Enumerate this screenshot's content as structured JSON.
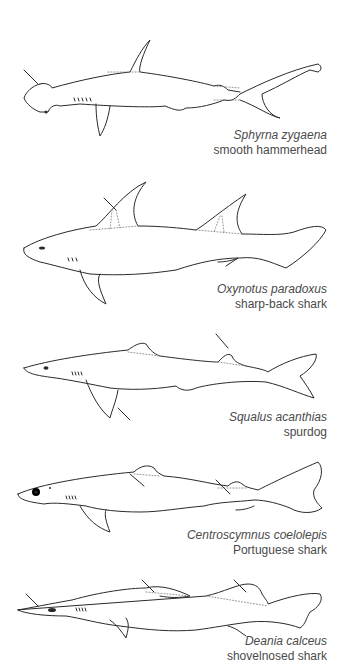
{
  "plates": [
    {
      "id": "smooth-hammerhead",
      "latin": "Sphyrna zygaena",
      "common": "smooth hammerhead"
    },
    {
      "id": "sharp-back-shark",
      "latin": "Oxynotus paradoxus",
      "common": "sharp-back shark"
    },
    {
      "id": "spurdog",
      "latin": "Squalus acanthias",
      "common": "spurdog"
    },
    {
      "id": "portuguese-shark",
      "latin": "Centroscymnus coelolepis",
      "common": "Portuguese shark"
    },
    {
      "id": "shovelnosed-shark",
      "latin": "Deania calceus",
      "common": "shovelnosed shark"
    }
  ],
  "colors": {
    "background": "#ffffff",
    "line": "#2a2a2a",
    "caption": "#4a4a4a"
  }
}
